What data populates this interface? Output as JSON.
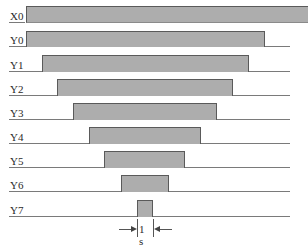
{
  "diagram": {
    "type": "timing-diagram",
    "signals": [
      {
        "name": "X0",
        "start_px": 26,
        "end_px": 308
      },
      {
        "name": "Y0",
        "start_px": 26,
        "end_px": 265
      },
      {
        "name": "Y1",
        "start_px": 42,
        "end_px": 249
      },
      {
        "name": "Y2",
        "start_px": 57,
        "end_px": 233
      },
      {
        "name": "Y3",
        "start_px": 73,
        "end_px": 217
      },
      {
        "name": "Y4",
        "start_px": 89,
        "end_px": 201
      },
      {
        "name": "Y5",
        "start_px": 104,
        "end_px": 185
      },
      {
        "name": "Y6",
        "start_px": 121,
        "end_px": 169
      },
      {
        "name": "Y7",
        "start_px": 137,
        "end_px": 153
      }
    ],
    "dimension": {
      "label": "1 s",
      "from_px": 137,
      "to_px": 153
    },
    "colors": {
      "pulse_fill": "#adadad",
      "pulse_border": "#5a5a5a",
      "baseline": "#7a7a7a",
      "text": "#2a2a2a"
    }
  }
}
